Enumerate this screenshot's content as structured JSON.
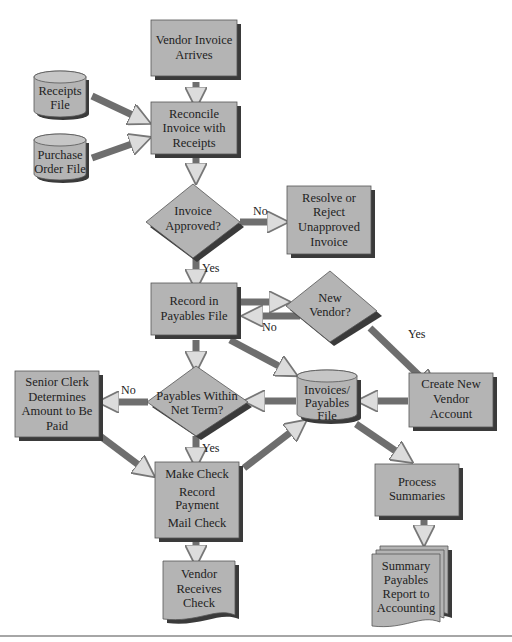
{
  "diagram": {
    "type": "flowchart",
    "nodes": {
      "vendor_invoice": {
        "shape": "process",
        "lines": [
          "Vendor Invoice",
          "Arrives"
        ]
      },
      "receipts_file": {
        "shape": "data-store",
        "lines": [
          "Receipts",
          "File"
        ]
      },
      "purchase_order_file": {
        "shape": "data-store",
        "lines": [
          "Purchase",
          "Order File"
        ]
      },
      "reconcile": {
        "shape": "process",
        "lines": [
          "Reconcile",
          "Invoice with",
          "Receipts"
        ]
      },
      "invoice_approved": {
        "shape": "decision",
        "lines": [
          "Invoice",
          "Approved?"
        ]
      },
      "resolve_reject": {
        "shape": "process",
        "lines": [
          "Resolve or",
          "Reject",
          "Unapproved",
          "Invoice"
        ]
      },
      "record_payables": {
        "shape": "process",
        "lines": [
          "Record in",
          "Payables File"
        ]
      },
      "new_vendor": {
        "shape": "decision",
        "lines": [
          "New",
          "Vendor?"
        ]
      },
      "create_vendor": {
        "shape": "process",
        "lines": [
          "Create New",
          "Vendor",
          "Account"
        ]
      },
      "invoices_payables_file": {
        "shape": "data-store",
        "lines": [
          "Invoices/",
          "Payables",
          "File"
        ]
      },
      "payables_within": {
        "shape": "decision",
        "lines": [
          "Payables Within",
          "Net Term?"
        ]
      },
      "senior_clerk": {
        "shape": "process",
        "lines": [
          "Senior Clerk",
          "Determines",
          "Amount to Be",
          "Paid"
        ]
      },
      "make_check": {
        "shape": "process",
        "lines": [
          "Make Check",
          "Record",
          "Payment",
          "Mail Check"
        ]
      },
      "vendor_receives": {
        "shape": "document",
        "lines": [
          "Vendor",
          "Receives",
          "Check"
        ]
      },
      "process_summaries": {
        "shape": "process",
        "lines": [
          "Process",
          "Summaries"
        ]
      },
      "summary_report": {
        "shape": "multi-document",
        "lines": [
          "Summary",
          "Payables",
          "Report to",
          "Accounting"
        ]
      }
    },
    "edge_labels": {
      "approved_no": "No",
      "approved_yes": "Yes",
      "new_vendor_no": "No",
      "new_vendor_yes": "Yes",
      "within_no": "No",
      "within_yes": "Yes"
    },
    "edges": [
      {
        "from": "vendor_invoice",
        "to": "reconcile"
      },
      {
        "from": "receipts_file",
        "to": "reconcile"
      },
      {
        "from": "purchase_order_file",
        "to": "reconcile"
      },
      {
        "from": "reconcile",
        "to": "invoice_approved"
      },
      {
        "from": "invoice_approved",
        "to": "resolve_reject",
        "label": "No"
      },
      {
        "from": "invoice_approved",
        "to": "record_payables",
        "label": "Yes"
      },
      {
        "from": "record_payables",
        "to": "new_vendor"
      },
      {
        "from": "new_vendor",
        "to": "record_payables",
        "label": "No"
      },
      {
        "from": "new_vendor",
        "to": "create_vendor",
        "label": "Yes"
      },
      {
        "from": "record_payables",
        "to": "invoices_payables_file"
      },
      {
        "from": "record_payables",
        "to": "payables_within"
      },
      {
        "from": "create_vendor",
        "to": "invoices_payables_file"
      },
      {
        "from": "invoices_payables_file",
        "to": "payables_within"
      },
      {
        "from": "payables_within",
        "to": "senior_clerk",
        "label": "No"
      },
      {
        "from": "payables_within",
        "to": "make_check",
        "label": "Yes"
      },
      {
        "from": "senior_clerk",
        "to": "make_check"
      },
      {
        "from": "make_check",
        "to": "invoices_payables_file"
      },
      {
        "from": "make_check",
        "to": "vendor_receives"
      },
      {
        "from": "invoices_payables_file",
        "to": "process_summaries"
      },
      {
        "from": "process_summaries",
        "to": "summary_report"
      }
    ],
    "colors": {
      "shape_fill": "#b4b4b4",
      "shadow": "#3a3a3a",
      "arrow": "#6e6e6e",
      "background": "#ffffff"
    }
  }
}
